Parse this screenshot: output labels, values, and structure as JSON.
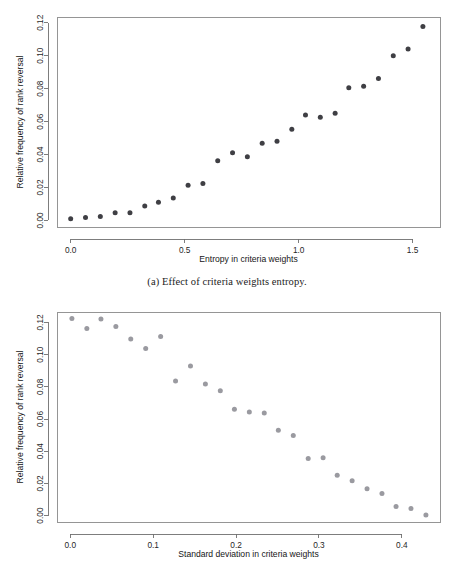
{
  "figure": {
    "caption_a": "(a) Effect of criteria weights entropy."
  },
  "chart_data": [
    {
      "id": "panel-a",
      "type": "scatter",
      "title": "",
      "xlabel": "Entropy in criteria weights",
      "ylabel": "Relative frequency of rank reversal",
      "xlim": [
        -0.06,
        1.62
      ],
      "ylim": [
        -0.004,
        0.1235
      ],
      "xticks": [
        0.0,
        0.5,
        1.0,
        1.5
      ],
      "xticklabels": [
        "0.0",
        "0.5",
        "1.0",
        "1.5"
      ],
      "yticks": [
        0.0,
        0.02,
        0.04,
        0.06,
        0.08,
        0.1,
        0.12
      ],
      "yticklabels": [
        "0.00",
        "0.02",
        "0.04",
        "0.06",
        "0.08",
        "0.10",
        "0.12"
      ],
      "grid": false,
      "legend": "none",
      "marker_color": "#3f3f44",
      "marker_size": 2.5,
      "x": [
        0.0,
        0.065,
        0.13,
        0.195,
        0.26,
        0.325,
        0.385,
        0.45,
        0.515,
        0.58,
        0.645,
        0.71,
        0.775,
        0.84,
        0.905,
        0.97,
        1.03,
        1.095,
        1.16,
        1.22,
        1.285,
        1.35,
        1.415,
        1.48,
        1.545
      ],
      "y": [
        0.001,
        0.0017,
        0.0023,
        0.0046,
        0.0046,
        0.0087,
        0.011,
        0.0136,
        0.0214,
        0.0224,
        0.0362,
        0.0411,
        0.0386,
        0.0468,
        0.0481,
        0.0554,
        0.064,
        0.0626,
        0.065,
        0.0806,
        0.0814,
        0.0862,
        0.1,
        0.1041,
        0.1177
      ]
    },
    {
      "id": "panel-b",
      "type": "scatter",
      "title": "",
      "xlabel": "Standard deviation in criteria weights",
      "ylabel": "Relative frequency of rank reversal",
      "xlim": [
        -0.016,
        0.446
      ],
      "ylim": [
        -0.004,
        0.1265
      ],
      "xticks": [
        0.0,
        0.1,
        0.2,
        0.3,
        0.4
      ],
      "xticklabels": [
        "0.0",
        "0.1",
        "0.2",
        "0.3",
        "0.4"
      ],
      "yticks": [
        0.0,
        0.02,
        0.04,
        0.06,
        0.08,
        0.1,
        0.12
      ],
      "yticklabels": [
        "0.00",
        "0.02",
        "0.04",
        "0.06",
        "0.08",
        "0.10",
        "0.12"
      ],
      "grid": false,
      "legend": "none",
      "marker_color": "#9a9aa0",
      "marker_size": 2.5,
      "x": [
        0.002,
        0.02,
        0.037,
        0.055,
        0.073,
        0.091,
        0.109,
        0.127,
        0.145,
        0.163,
        0.181,
        0.198,
        0.216,
        0.234,
        0.251,
        0.269,
        0.287,
        0.305,
        0.322,
        0.34,
        0.358,
        0.376,
        0.393,
        0.411,
        0.429
      ],
      "y": [
        0.1225,
        0.1163,
        0.1222,
        0.1175,
        0.1097,
        0.1038,
        0.1112,
        0.0836,
        0.0929,
        0.0817,
        0.0775,
        0.0661,
        0.0643,
        0.0638,
        0.053,
        0.0498,
        0.0354,
        0.0359,
        0.0251,
        0.0216,
        0.0166,
        0.0137,
        0.0056,
        0.0044,
        0.0004
      ]
    }
  ]
}
